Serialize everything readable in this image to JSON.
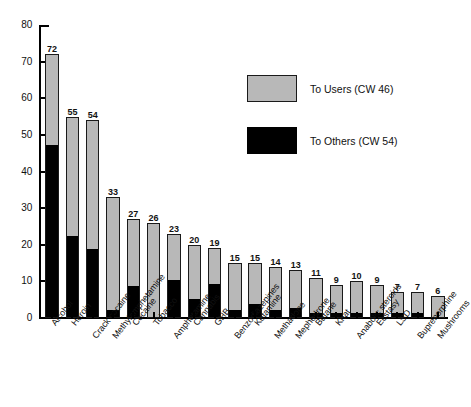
{
  "chart_data": {
    "type": "bar",
    "subtype": "stacked-bar",
    "title": "",
    "xlabel": "",
    "ylabel": "",
    "ylim": [
      0,
      80
    ],
    "ytick_step": 10,
    "yticks": [
      0,
      10,
      20,
      30,
      40,
      50,
      60,
      70,
      80
    ],
    "grid": false,
    "legend_position": "upper-right-inside",
    "categories": [
      "Alcohol",
      "Heroin",
      "Crack cocaine",
      "Methylamphetamine",
      "Cocaine",
      "Tobacco",
      "Amphetamine",
      "Cannabis",
      "GHB",
      "Benzodiazepines",
      "Ketamine",
      "Methadone",
      "Mephedrone",
      "Butane",
      "Khat",
      "Anabolic steroids",
      "Ecstasy",
      "LSD",
      "Buprenorphine",
      "Mushrooms"
    ],
    "totals": [
      72,
      55,
      54,
      33,
      27,
      26,
      23,
      20,
      19,
      15,
      15,
      14,
      13,
      11,
      9,
      10,
      9,
      7,
      7,
      6
    ],
    "series": [
      {
        "name": "To Others (CW 54)",
        "color": "#000000",
        "values": [
          47,
          22,
          18.5,
          2,
          8.5,
          0,
          10,
          5,
          9,
          2,
          3.5,
          2,
          2.5,
          1,
          1,
          1,
          1,
          1,
          1,
          0
        ]
      },
      {
        "name": "To Users (CW 46)",
        "color": "#b8b8b8",
        "values": [
          25,
          33,
          35.5,
          31,
          18.5,
          26,
          13,
          15,
          10,
          13,
          11.5,
          12,
          10.5,
          10,
          8,
          9,
          8,
          6,
          6,
          6
        ]
      }
    ],
    "data_labels": [
      "72",
      "55",
      "54",
      "33",
      "27",
      "26",
      "23",
      "20",
      "19",
      "15",
      "15",
      "14",
      "13",
      "11",
      "9",
      "10",
      "9",
      "7",
      "7",
      "6"
    ]
  },
  "legend": {
    "items": [
      {
        "label": "To Users (CW 46)",
        "color": "#b8b8b8",
        "swatch": "users"
      },
      {
        "label": "To Others (CW 54)",
        "color": "#000000",
        "swatch": "others"
      }
    ]
  },
  "axis": {
    "y_tick_labels": [
      "80",
      "70",
      "60",
      "50",
      "40",
      "30",
      "20",
      "10",
      "0"
    ]
  }
}
